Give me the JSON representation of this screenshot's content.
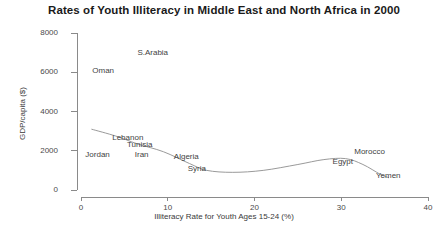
{
  "chart_data": {
    "type": "scatter",
    "title": "Rates of Youth Illiteracy in Middle East and North Africa in 2000",
    "xlabel": "Illiteracy Rate for Youth Ages 15-24 (%)",
    "ylabel": "GDP/capita ($)",
    "xlim": [
      0,
      40
    ],
    "ylim": [
      0,
      8000
    ],
    "xticks": [
      "0",
      "10",
      "20",
      "30",
      "40"
    ],
    "xtick_values": [
      0,
      10,
      20,
      30,
      40
    ],
    "yticks": [
      "0",
      "2000",
      "4000",
      "6000",
      "8000"
    ],
    "ytick_values": [
      0,
      2000,
      4000,
      6000,
      8000
    ],
    "grid": false,
    "legend": "none",
    "marker_style": "text-label-only",
    "curve_color": "#9a9a9a",
    "axis_color": "#8a8a8a",
    "points": [
      {
        "label": "Oman",
        "x": 1.3,
        "y": 6050
      },
      {
        "label": "S.Arabia",
        "x": 6.5,
        "y": 7000
      },
      {
        "label": "Jordan",
        "x": 0.5,
        "y": 1800
      },
      {
        "label": "Lebanon",
        "x": 3.6,
        "y": 2650
      },
      {
        "label": "Tunisia",
        "x": 5.3,
        "y": 2300
      },
      {
        "label": "Iran",
        "x": 6.2,
        "y": 1800
      },
      {
        "label": "Algeria",
        "x": 10.7,
        "y": 1700
      },
      {
        "label": "Syria",
        "x": 12.3,
        "y": 1050
      },
      {
        "label": "Egypt",
        "x": 29.0,
        "y": 1450
      },
      {
        "label": "Morocco",
        "x": 31.5,
        "y": 1950
      },
      {
        "label": "Yemen",
        "x": 34.0,
        "y": 700
      }
    ],
    "trend_curve": [
      {
        "x": 1.2,
        "y": 3100
      },
      {
        "x": 4.0,
        "y": 2750
      },
      {
        "x": 6.5,
        "y": 2350
      },
      {
        "x": 9.5,
        "y": 1950
      },
      {
        "x": 12.5,
        "y": 1350
      },
      {
        "x": 14.5,
        "y": 1000
      },
      {
        "x": 17.5,
        "y": 900
      },
      {
        "x": 21.0,
        "y": 1000
      },
      {
        "x": 25.0,
        "y": 1300
      },
      {
        "x": 28.0,
        "y": 1550
      },
      {
        "x": 30.5,
        "y": 1600
      },
      {
        "x": 32.5,
        "y": 1300
      },
      {
        "x": 34.5,
        "y": 800
      },
      {
        "x": 35.5,
        "y": 620
      }
    ]
  }
}
